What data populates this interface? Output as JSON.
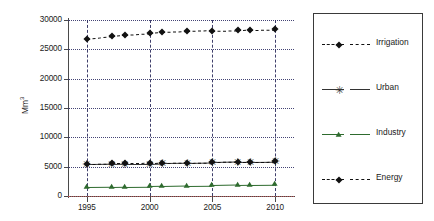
{
  "chart_data": {
    "type": "line",
    "title": "",
    "xlabel": "",
    "ylabel": "Mm3",
    "ylabel_display": "Mm³",
    "xlim": [
      1993.5,
      2011.5
    ],
    "ylim": [
      0,
      30000
    ],
    "ytick_labels": [
      "0",
      "5000",
      "10000",
      "15000",
      "20000",
      "25000",
      "30000"
    ],
    "ytick_values": [
      0,
      5000,
      10000,
      15000,
      20000,
      25000,
      30000
    ],
    "xtick_labels": [
      "1995",
      "2000",
      "2005",
      "2010"
    ],
    "xtick_values": [
      1995,
      2000,
      2005,
      2010
    ],
    "grid": true,
    "grid_horizontal_style": "dotted",
    "grid_vertical_style": "dashed",
    "legend_position": "right-outside",
    "legend_boxed": true,
    "x": [
      1995,
      1997,
      1998,
      2000,
      2001,
      2003,
      2005,
      2007,
      2008,
      2010
    ],
    "series": [
      {
        "name": "Irrigation",
        "marker": "diamond",
        "linestyle": "dashed",
        "color": "#111111",
        "values": [
          26700,
          27200,
          27400,
          27700,
          27900,
          28050,
          28200,
          28300,
          28350,
          28400
        ]
      },
      {
        "name": "Urban",
        "marker": "star",
        "linestyle": "solid",
        "color": "#333333",
        "values": [
          5400,
          5450,
          5500,
          5520,
          5600,
          5650,
          5720,
          5800,
          5850,
          5900
        ]
      },
      {
        "name": "Industry",
        "marker": "triangle",
        "linestyle": "solid",
        "color": "#2e6b2e",
        "values": [
          1500,
          1560,
          1600,
          1650,
          1700,
          1780,
          1830,
          1900,
          1950,
          2000
        ]
      },
      {
        "name": "Energy",
        "marker": "diamond",
        "linestyle": "dashed",
        "color": "#111111",
        "values": [
          5500,
          5550,
          5570,
          5600,
          5650,
          5700,
          5780,
          5840,
          5870,
          5900
        ]
      }
    ]
  },
  "legend": {
    "items": [
      {
        "label": "Irrigation",
        "marker": "diamond",
        "linestyle": "dashed"
      },
      {
        "label": "Urban",
        "marker": "star",
        "linestyle": "solid"
      },
      {
        "label": "Industry",
        "marker": "triangle",
        "linestyle": "solid"
      },
      {
        "label": "Energy",
        "marker": "diamond",
        "linestyle": "dashed"
      }
    ]
  }
}
